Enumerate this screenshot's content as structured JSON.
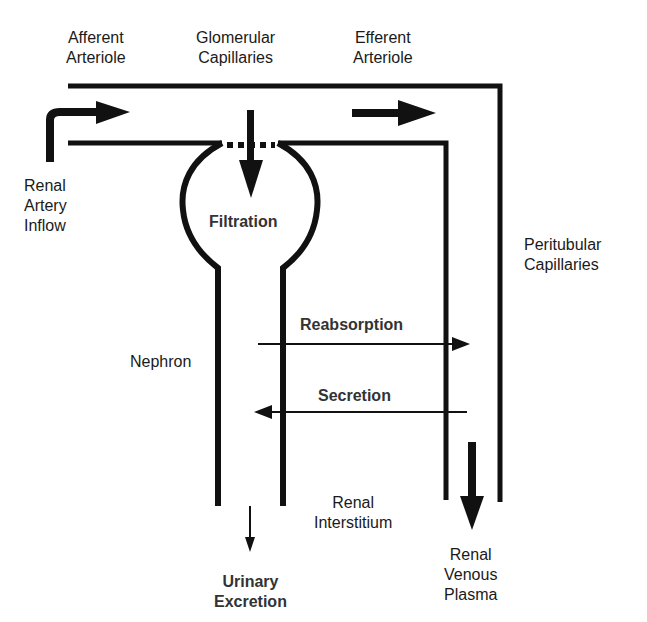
{
  "diagram": {
    "labels": {
      "afferent_arteriole": "Afferent\nArteriole",
      "glomerular_capillaries": "Glomerular\nCapillaries",
      "efferent_arteriole": "Efferent\nArteriole",
      "renal_artery_inflow": "Renal\nArtery\nInflow",
      "filtration": "Filtration",
      "peritubular_capillaries": "Peritubular\nCapillaries",
      "reabsorption": "Reabsorption",
      "nephron": "Nephron",
      "secretion": "Secretion",
      "renal_interstitium": "Renal\nInterstitium",
      "urinary_excretion": "Urinary\nExcretion",
      "renal_venous_plasma": "Renal\nVenous\nPlasma"
    },
    "colors": {
      "stroke": "#111111",
      "text": "#1a1a1a",
      "background": "#ffffff"
    }
  }
}
